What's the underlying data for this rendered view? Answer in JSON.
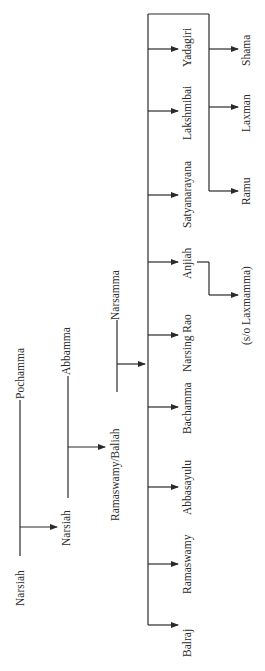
{
  "diagram": {
    "type": "family-tree",
    "orientation": "rotated-90-ccw",
    "line_color": "#2a2a2a",
    "generations": [
      {
        "person": "Narsiah",
        "spouse": "Pochamma"
      },
      {
        "person": "Narsiah",
        "spouse": "Abbamma"
      },
      {
        "person": "Ramaswamy/Baliah",
        "spouse": "Narsamma"
      }
    ],
    "children": [
      {
        "name": "Balraj"
      },
      {
        "name": "Ramaswamy"
      },
      {
        "name": "Abbasayulu"
      },
      {
        "name": "Bachamma"
      },
      {
        "name": "Narsing Rao"
      },
      {
        "name": "Anjiah"
      },
      {
        "name": "Satyanarayana"
      },
      {
        "name": "Lakshmibai"
      },
      {
        "name": "Yadagiri"
      }
    ],
    "grandchildren": {
      "anjiah_child": "(s/o Laxmamma)",
      "yadagiri_children": [
        "Ramu",
        "Laxman",
        "Shama"
      ]
    }
  }
}
